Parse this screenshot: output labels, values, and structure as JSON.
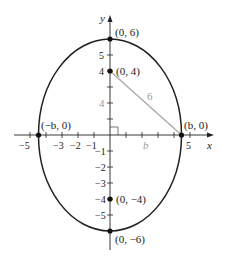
{
  "diagram": {
    "type": "ellipse-on-axes",
    "axes": {
      "x_label": "x",
      "y_label": "y"
    },
    "x_ticks": [
      {
        "value": -5,
        "label": "−5"
      },
      {
        "value": -3,
        "label": "−3"
      },
      {
        "value": -2,
        "label": "−2"
      },
      {
        "value": -1,
        "label": "−1"
      },
      {
        "value": 5,
        "label": "5"
      }
    ],
    "y_ticks": [
      {
        "value": 5,
        "label": "5"
      },
      {
        "value": 4,
        "label": "4"
      },
      {
        "value": -1,
        "label": "−1"
      },
      {
        "value": -2,
        "label": "−2"
      },
      {
        "value": -3,
        "label": "−3"
      },
      {
        "value": -4,
        "label": "−4"
      },
      {
        "value": -5,
        "label": "−5"
      }
    ],
    "points": [
      {
        "label": "(0, 6)"
      },
      {
        "label": "(0, 4)"
      },
      {
        "label": "(−b, 0)"
      },
      {
        "label": "(b, 0)"
      },
      {
        "label": "(0, −4)"
      },
      {
        "label": "(0, −6)"
      }
    ],
    "triangle": {
      "hypotenuse_label": "6",
      "vertical_leg_label": "4",
      "horizontal_leg_label": "b",
      "color": "#9a9a9a"
    },
    "ellipse": {
      "semi_major": 6,
      "semi_minor": "b"
    }
  }
}
